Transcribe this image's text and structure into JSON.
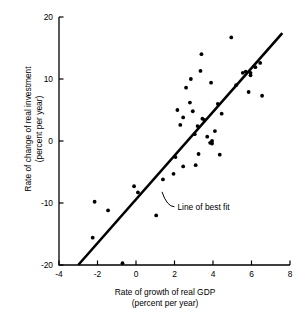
{
  "chart_data": {
    "type": "scatter",
    "title": "",
    "xlabel": "Rate of growth of real GDP",
    "xlabel_sub": "(percent per year)",
    "ylabel": "Rate of change of real investment",
    "ylabel_sub": "(percent per year)",
    "xlim": [
      -4,
      8
    ],
    "ylim": [
      -20,
      20
    ],
    "xticks": [
      -4,
      -2,
      0,
      2,
      4,
      6,
      8
    ],
    "xtick_labels": [
      "-4",
      "-2",
      "0",
      "2",
      "4",
      "6",
      "8"
    ],
    "yticks": [
      -20,
      -10,
      0,
      10,
      20
    ],
    "ytick_labels": [
      "-20",
      "-10",
      "0",
      "10",
      "20"
    ],
    "grid": false,
    "legend": "none",
    "marker_color": "#000000",
    "line_color": "#000000",
    "annotations": [
      {
        "text": "Line of best fit",
        "x": 2.1,
        "y": -10.6,
        "leader_from_x": 1.35,
        "leader_from_y": -8.2
      }
    ],
    "fit_line": {
      "label": "Line of best fit",
      "slope": 3.48,
      "intercept": -9.55,
      "x_start": -3.0,
      "y_start": -20.0,
      "x_end": 7.6,
      "y_end": 17.4
    },
    "points": [
      {
        "x": -2.25,
        "y": -15.6
      },
      {
        "x": -0.7,
        "y": -19.7
      },
      {
        "x": -2.15,
        "y": -9.8
      },
      {
        "x": -1.45,
        "y": -11.2
      },
      {
        "x": -0.1,
        "y": -7.3
      },
      {
        "x": 0.1,
        "y": -8.3
      },
      {
        "x": 1.4,
        "y": -6.2
      },
      {
        "x": 1.95,
        "y": -5.3
      },
      {
        "x": 2.05,
        "y": -2.6
      },
      {
        "x": 2.45,
        "y": -4.1
      },
      {
        "x": 2.3,
        "y": 2.6
      },
      {
        "x": 2.45,
        "y": 3.8
      },
      {
        "x": 2.6,
        "y": 8.6
      },
      {
        "x": 2.85,
        "y": 10.0
      },
      {
        "x": 2.8,
        "y": 6.2
      },
      {
        "x": 2.95,
        "y": 4.8
      },
      {
        "x": 3.1,
        "y": -3.9
      },
      {
        "x": 3.25,
        "y": -2.1
      },
      {
        "x": 3.05,
        "y": 1.1
      },
      {
        "x": 3.2,
        "y": 2.4
      },
      {
        "x": 3.35,
        "y": 11.3
      },
      {
        "x": 3.4,
        "y": 14.0
      },
      {
        "x": 3.45,
        "y": 3.6
      },
      {
        "x": 3.55,
        "y": 3.4
      },
      {
        "x": 3.7,
        "y": 0.7
      },
      {
        "x": 3.85,
        "y": -0.3
      },
      {
        "x": 3.95,
        "y": -0.4
      },
      {
        "x": 3.95,
        "y": 0.0
      },
      {
        "x": 3.9,
        "y": 9.4
      },
      {
        "x": 4.25,
        "y": 6.0
      },
      {
        "x": 4.35,
        "y": -2.2
      },
      {
        "x": 4.45,
        "y": 4.4
      },
      {
        "x": 4.95,
        "y": 16.7
      },
      {
        "x": 5.2,
        "y": 9.0
      },
      {
        "x": 5.55,
        "y": 11.0
      },
      {
        "x": 5.7,
        "y": 11.2
      },
      {
        "x": 5.95,
        "y": 11.0
      },
      {
        "x": 5.95,
        "y": 10.6
      },
      {
        "x": 5.85,
        "y": 7.9
      },
      {
        "x": 6.2,
        "y": 11.9
      },
      {
        "x": 6.45,
        "y": 12.6
      },
      {
        "x": 6.55,
        "y": 7.3
      },
      {
        "x": 1.05,
        "y": -12.0
      },
      {
        "x": 4.1,
        "y": 1.6
      },
      {
        "x": 2.15,
        "y": 5.0
      }
    ]
  }
}
